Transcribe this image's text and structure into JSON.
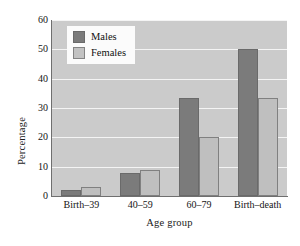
{
  "chart_data": {
    "type": "bar",
    "title": "",
    "subtitle": "",
    "xlabel": "Age group",
    "ylabel": "Percentage",
    "categories": [
      "Birth–39",
      "40–59",
      "60–79",
      "Birth–death"
    ],
    "series": [
      {
        "name": "Males",
        "values": [
          2,
          8,
          33.5,
          50
        ],
        "color": "#7b7b7b"
      },
      {
        "name": "Females",
        "values": [
          3,
          9,
          20,
          33.5
        ],
        "color": "#bfbfbf"
      }
    ],
    "ylim": [
      0,
      60
    ],
    "ytick_values": [
      0,
      10,
      20,
      30,
      40,
      50,
      60
    ],
    "ytick_labels": [
      "0",
      "10",
      "20",
      "30",
      "40",
      "50",
      "60"
    ],
    "grid": "horizontal",
    "legend_position": "top-left-inside",
    "plot_background": "#cbcbcb",
    "gridline_color": "#f4f4f4",
    "axis_color": "#6f6f6f"
  },
  "legend": {
    "items": [
      {
        "label": "Males"
      },
      {
        "label": "Females"
      }
    ]
  },
  "axes": {
    "y_title": "Percentage",
    "x_title": "Age group"
  }
}
